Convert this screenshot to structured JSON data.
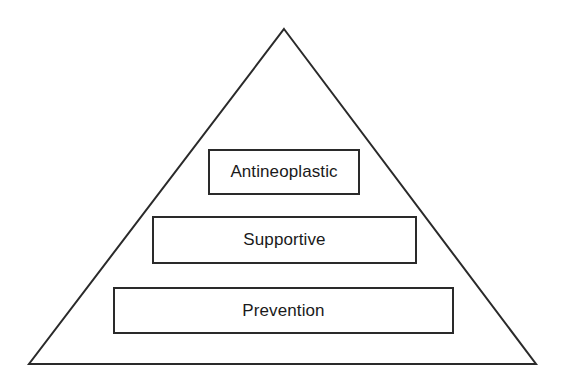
{
  "diagram": {
    "type": "pyramid",
    "colors": {
      "background": "#ffffff",
      "line": "#2a2a2a",
      "text": "#1a1a1a"
    },
    "tiers": [
      {
        "position": "top",
        "label": "Antineoplastic"
      },
      {
        "position": "middle",
        "label": "Supportive"
      },
      {
        "position": "bottom",
        "label": "Prevention"
      }
    ]
  }
}
